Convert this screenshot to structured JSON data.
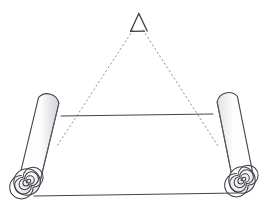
{
  "figure": {
    "background_color": "#ffffff",
    "stroke_color": "#3c3c46",
    "shade_color": "#c8c8cd",
    "dotted_color": "#8c8c96",
    "width": 269,
    "height": 214
  },
  "apex_marker": {
    "label": "triangle-apex-marker",
    "shape": "open-triangle",
    "x": 138,
    "y": 14,
    "width": 17,
    "height": 18
  },
  "sight_lines": {
    "label": "dotted-projection-lines",
    "style": "dotted",
    "left": {
      "x1": 133,
      "y1": 30,
      "x2": 57,
      "y2": 146
    },
    "right": {
      "x1": 143,
      "y1": 30,
      "x2": 218,
      "y2": 146
    }
  },
  "sheet": {
    "label": "scroll-sheet",
    "top_edge": {
      "x1": 61,
      "y1": 116,
      "x2": 213,
      "y2": 114
    },
    "bottom_edge": {
      "x1": 34,
      "y1": 196,
      "x2": 238,
      "y2": 193
    },
    "fill": "#ffffff"
  },
  "rolls": [
    {
      "name": "left-roll",
      "side": "left",
      "top_x": 48,
      "top_y": 99,
      "bottom_x": 27,
      "bottom_y": 182,
      "radius": 12,
      "spiral_turns": 5,
      "spiral_center": {
        "x": 27,
        "y": 182
      },
      "spiral_radius": 13
    },
    {
      "name": "right-roll",
      "side": "right",
      "top_x": 228,
      "top_y": 98,
      "bottom_x": 242,
      "bottom_y": 180,
      "radius": 12,
      "spiral_turns": 5,
      "spiral_center": {
        "x": 242,
        "y": 180
      },
      "spiral_radius": 13
    }
  ]
}
